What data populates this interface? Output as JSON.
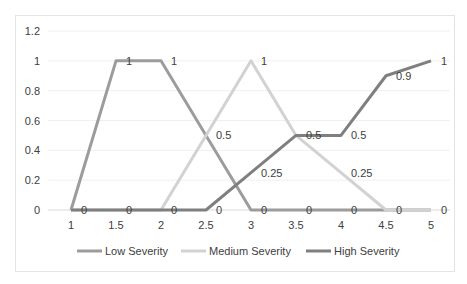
{
  "chart_data": {
    "type": "line",
    "title": "",
    "xlabel": "",
    "ylabel": "",
    "x": [
      1,
      1.5,
      2,
      2.5,
      3,
      3.5,
      4,
      4.5,
      5
    ],
    "x_tick_labels": [
      "1",
      "1.5",
      "2",
      "2.5",
      "3",
      "3.5",
      "4",
      "4.5",
      "5"
    ],
    "y_tick_labels": [
      "0",
      "0.2",
      "0.4",
      "0.6",
      "0.8",
      "1",
      "1.2"
    ],
    "ylim": [
      0,
      1.2
    ],
    "grid": true,
    "legend_position": "bottom",
    "series": [
      {
        "name": "Low Severity",
        "color": "#9c9c9c",
        "values": [
          0,
          1,
          1,
          0.5,
          0,
          0,
          0,
          0,
          0
        ]
      },
      {
        "name": "Medium Severity",
        "color": "#d2d2d2",
        "values": [
          0,
          0,
          0,
          0.5,
          1,
          0.5,
          0.25,
          0,
          0
        ]
      },
      {
        "name": "High Severity",
        "color": "#7f7f7f",
        "values": [
          0,
          0,
          0,
          0,
          0.25,
          0.5,
          0.5,
          0.9,
          1
        ]
      }
    ],
    "data_labels": [
      {
        "text": "0",
        "x": 1,
        "y": 0
      },
      {
        "text": "1",
        "x": 1.5,
        "y": 1
      },
      {
        "text": "0",
        "x": 1.5,
        "y": 0
      },
      {
        "text": "1",
        "x": 2,
        "y": 1
      },
      {
        "text": "0",
        "x": 2,
        "y": 0
      },
      {
        "text": "0.5",
        "x": 2.5,
        "y": 0.5
      },
      {
        "text": "0",
        "x": 2.5,
        "y": 0
      },
      {
        "text": "1",
        "x": 3,
        "y": 1
      },
      {
        "text": "0.25",
        "x": 3,
        "y": 0.25
      },
      {
        "text": "0",
        "x": 3,
        "y": 0
      },
      {
        "text": "0.5",
        "x": 3.5,
        "y": 0.5
      },
      {
        "text": "0",
        "x": 3.5,
        "y": 0
      },
      {
        "text": "0.5",
        "x": 4,
        "y": 0.5
      },
      {
        "text": "0.25",
        "x": 4,
        "y": 0.25
      },
      {
        "text": "0",
        "x": 4,
        "y": 0
      },
      {
        "text": "0.9",
        "x": 4.5,
        "y": 0.9
      },
      {
        "text": "0",
        "x": 4.5,
        "y": 0
      },
      {
        "text": "1",
        "x": 5,
        "y": 1
      },
      {
        "text": "0",
        "x": 5,
        "y": 0
      }
    ]
  }
}
